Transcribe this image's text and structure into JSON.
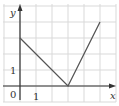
{
  "chart_data": {
    "type": "line",
    "title": "",
    "xlabel": "x",
    "ylabel": "y",
    "origin_label": "0",
    "x_tick_label": "1",
    "y_tick_label": "1",
    "grid": true,
    "xlim": [
      -1,
      6
    ],
    "ylim": [
      -0.5,
      5
    ],
    "series": [
      {
        "name": "piecewise",
        "points": [
          [
            0,
            3
          ],
          [
            3,
            0
          ],
          [
            5,
            4
          ]
        ]
      }
    ]
  },
  "colors": {
    "grid": "#d9d9d9",
    "axis": "#333333",
    "line": "#555555"
  }
}
